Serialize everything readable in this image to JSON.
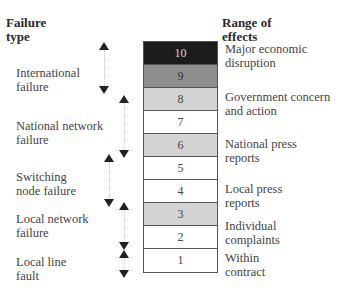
{
  "headers": {
    "left": [
      "Failure",
      "type"
    ],
    "right": [
      "Range of",
      "effects"
    ]
  },
  "failure_types": [
    {
      "lines": [
        "International",
        "failure"
      ]
    },
    {
      "lines": [
        "National network",
        "failure"
      ]
    },
    {
      "lines": [
        "Switching",
        "node failure"
      ]
    },
    {
      "lines": [
        "Local network",
        "failure"
      ]
    },
    {
      "lines": [
        "Local line",
        "fault"
      ]
    }
  ],
  "scale": [
    {
      "value": "10",
      "fill": "#1c1c1c",
      "text_color": "#d8d8d8"
    },
    {
      "value": "9",
      "fill": "#8f8f8f",
      "text_color": "#333333"
    },
    {
      "value": "8",
      "fill": "#d4d4d4",
      "text_color": "#444444"
    },
    {
      "value": "7",
      "fill": "#ffffff",
      "text_color": "#444444"
    },
    {
      "value": "6",
      "fill": "#d4d4d4",
      "text_color": "#444444"
    },
    {
      "value": "5",
      "fill": "#ffffff",
      "text_color": "#444444"
    },
    {
      "value": "4",
      "fill": "#ffffff",
      "text_color": "#444444"
    },
    {
      "value": "3",
      "fill": "#d4d4d4",
      "text_color": "#444444"
    },
    {
      "value": "2",
      "fill": "#ffffff",
      "text_color": "#444444"
    },
    {
      "value": "1",
      "fill": "#ffffff",
      "text_color": "#444444"
    }
  ],
  "effects": [
    {
      "lines": [
        "Major economic",
        "disruption"
      ]
    },
    {
      "lines": [
        "Government concern",
        "and action"
      ]
    },
    {
      "lines": [
        "National press",
        "reports"
      ]
    },
    {
      "lines": [
        "Local press",
        "reports"
      ]
    },
    {
      "lines": [
        "Individual",
        "complaints"
      ]
    },
    {
      "lines": [
        "Within",
        "contract"
      ]
    }
  ]
}
